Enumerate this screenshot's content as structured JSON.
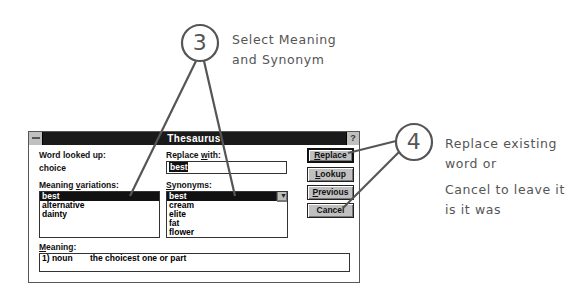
{
  "dialog": {
    "title": "Thesaurus",
    "help_label": "?",
    "word_looked_up_label": "Word looked up:",
    "word_looked_up_value": "choice",
    "replace_with_label_pre": "Replace ",
    "replace_with_label_u": "w",
    "replace_with_label_post": "ith:",
    "replace_with_value": "best",
    "meaning_variations_label_pre": "Meaning ",
    "meaning_variations_label_u": "v",
    "meaning_variations_label_post": "ariations:",
    "meaning_variations": [
      "best",
      "alternative",
      "dainty"
    ],
    "synonyms_label_u": "S",
    "synonyms_label_post": "ynonyms:",
    "synonyms": [
      "best",
      "cream",
      "elite",
      "fat",
      "flower"
    ],
    "meaning_label_u": "M",
    "meaning_label_post": "eaning:",
    "meaning_number": "1) noun",
    "meaning_text": "the choicest one or part",
    "buttons": {
      "replace": {
        "u": "R",
        "rest": "eplace"
      },
      "lookup": {
        "u": "L",
        "rest": "ookup"
      },
      "previous": {
        "u": "P",
        "rest": "revious"
      },
      "cancel": {
        "label": "Cancel"
      }
    }
  },
  "annotations": {
    "step3": {
      "number": "3",
      "line1": "Select Meaning",
      "line2": "and Synonym"
    },
    "step4": {
      "number": "4",
      "line1": "Replace existing",
      "line2": "word or",
      "line3": "Cancel to leave it",
      "line4": "is it was"
    }
  }
}
